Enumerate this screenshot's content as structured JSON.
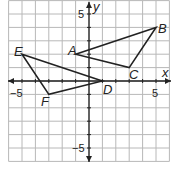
{
  "diagram": {
    "type": "coordinate-plane",
    "x_range": [
      -6,
      6
    ],
    "y_range": [
      -6,
      6
    ],
    "axis_labels": {
      "x": "x",
      "y": "y"
    },
    "tick_labels": {
      "x_neg": "−5",
      "x_pos": "5",
      "y_pos": "5",
      "y_neg": "−5"
    },
    "triangles": [
      {
        "name": "ABC",
        "vertices": [
          {
            "label": "A",
            "x": -1,
            "y": 2
          },
          {
            "label": "B",
            "x": 5,
            "y": 4
          },
          {
            "label": "C",
            "x": 3,
            "y": 1
          }
        ]
      },
      {
        "name": "DEF",
        "vertices": [
          {
            "label": "D",
            "x": 1,
            "y": 0
          },
          {
            "label": "E",
            "x": -5,
            "y": 2
          },
          {
            "label": "F",
            "x": -3,
            "y": -1
          }
        ]
      }
    ],
    "colors": {
      "grid": "#b5b5b5",
      "lines": "#222222",
      "background": "#ffffff"
    }
  }
}
